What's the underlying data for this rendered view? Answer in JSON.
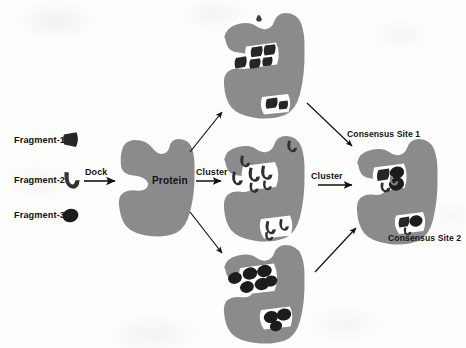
{
  "figure": {
    "background_color": "#fdfdfc"
  },
  "colors": {
    "protein_fill": "#8b8b8b",
    "protein_fill_light": "#949494",
    "pocket_fill": "#ffffff",
    "fragment_dark": "#1c1c1c",
    "fragment_mid": "#3a3a3a",
    "text": "#131313",
    "arrow": "#111111"
  },
  "fragments": [
    {
      "id": "fragment-1",
      "label": "Fragment-1",
      "shape": "triangle",
      "color": "#262626"
    },
    {
      "id": "fragment-2",
      "label": "Fragment-2",
      "shape": "crescent",
      "color": "#303030"
    },
    {
      "id": "fragment-3",
      "label": "Fragment-3",
      "shape": "ellipse",
      "color": "#1c1c1c"
    }
  ],
  "process_labels": {
    "dock": "Dock",
    "cluster_1": "Cluster",
    "cluster_2": "Cluster"
  },
  "nodes": {
    "protein": {
      "label": "Protein",
      "description": "Apo protein target with binding cleft"
    },
    "docked_top": {
      "description": "Protein with docked Fragment-1 triangles in two pockets"
    },
    "docked_middle": {
      "description": "Protein with docked Fragment-2 crescents in two pockets"
    },
    "docked_bottom": {
      "description": "Protein with docked Fragment-3 ellipses in two pockets"
    },
    "consensus": {
      "description": "Protein showing consensus binding sites from all fragments"
    }
  },
  "annotations": {
    "consensus_site_1": "Consensus Site 1",
    "consensus_site_2": "Consensus Site 2"
  }
}
